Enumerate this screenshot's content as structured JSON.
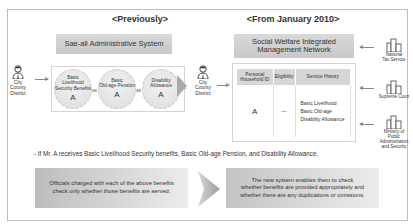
{
  "headings": {
    "previously": "<Previously>",
    "from_2010": "<From January 2010>"
  },
  "systems": {
    "old": "Sae-all Administrative System",
    "new_line1": "Social Welfare Integrated",
    "new_line2": "Management Network"
  },
  "actors": {
    "left_line1": "City",
    "left_line2": "County",
    "left_line3": "District",
    "right_line1": "City",
    "right_line2": "County",
    "right_line3": "District"
  },
  "benefits": [
    {
      "line1": "Basic",
      "line2": "Livelihood",
      "line3": "Security Benefits",
      "recipient": "A"
    },
    {
      "line1": "Basic",
      "line2": "Old-age Pension",
      "line3": "",
      "recipient": "A"
    },
    {
      "line1": "Disability",
      "line2": "Allowance",
      "line3": "",
      "recipient": "A"
    }
  ],
  "benefit_links": [
    "⋈",
    "⋈"
  ],
  "ellipsis": "···",
  "table": {
    "headers": [
      "Personal Household ID",
      "Eligibility",
      "Service History"
    ],
    "row": {
      "id": "A",
      "eligibility": "—",
      "history": [
        "Basic Livelihood",
        "Basic Old-age",
        "Disability Allowance"
      ]
    }
  },
  "organizations": [
    {
      "line1": "National",
      "line2": "Tax Service",
      "line3": ""
    },
    {
      "line1": "Supreme Court",
      "line2": "",
      "line3": ""
    },
    {
      "line1": "Ministry of",
      "line2": "Public Administration",
      "line3": "and Security"
    }
  ],
  "note": "- If Mr. A receives Basic Livelihood Security benefits, Basic Old-age Pension, and Disability Allowance,",
  "panels": {
    "before_line1": "Officials charged with each of the above benefits",
    "before_line2": "check only whether those benefits are served.",
    "after_line1": "The new system enables them to check",
    "after_line2": "whether benefits are provided appropriately and",
    "after_line3": "whether there are any duplications or omissions."
  },
  "colors": {
    "bar_gray": "#cfcfcf",
    "border": "#bdbdbd",
    "arrow": "#a9a9a9"
  }
}
